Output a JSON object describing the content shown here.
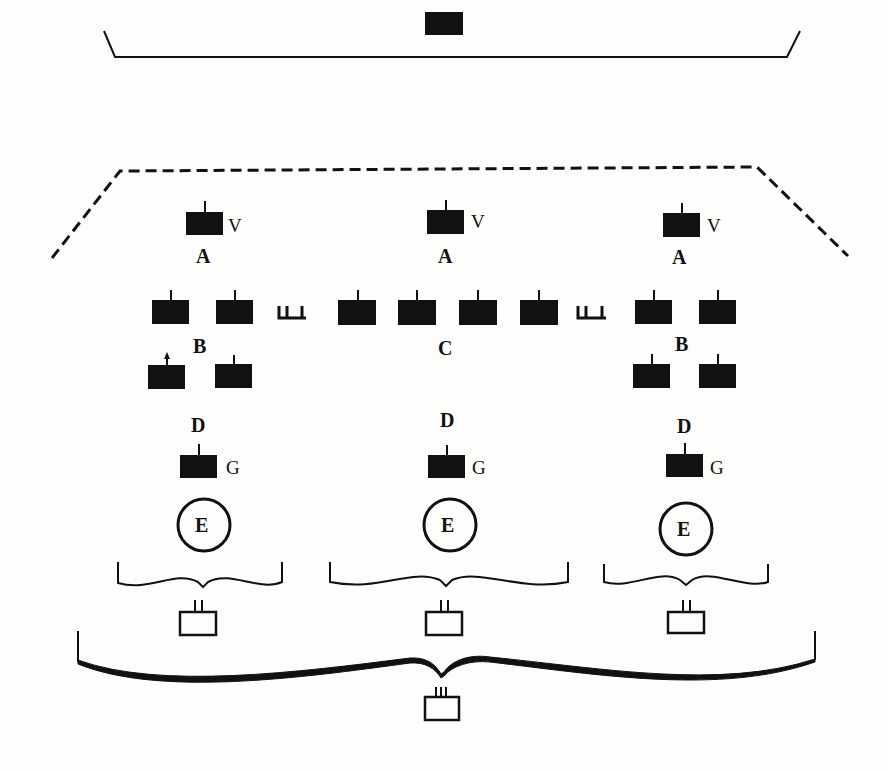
{
  "diagram": {
    "title": "",
    "top": {
      "node": "solid-unit",
      "bracket": "solid-tray-bracket"
    },
    "group_boundary": "dashed-trapezoid",
    "columns": [
      {
        "id": "left",
        "top_unit": {
          "label": "A",
          "side_label": "V"
        },
        "middle_label": "B",
        "middle_units_rows": [
          2,
          2
        ],
        "weapon_symbol_after": true,
        "lower": {
          "label": "D",
          "side_label": "G"
        },
        "circle_label": "E",
        "bracket": "brace",
        "base_box_marks": 2
      },
      {
        "id": "center",
        "top_unit": {
          "label": "A",
          "side_label": "V"
        },
        "middle_label": "C",
        "middle_units_rows": [
          4
        ],
        "weapon_symbol_after": true,
        "lower": {
          "label": "D",
          "side_label": "G"
        },
        "circle_label": "E",
        "bracket": "brace",
        "base_box_marks": 2
      },
      {
        "id": "right",
        "top_unit": {
          "label": "A",
          "side_label": "V"
        },
        "middle_label": "B",
        "middle_units_rows": [
          2,
          2
        ],
        "weapon_symbol_after": false,
        "lower": {
          "label": "D",
          "side_label": "G"
        },
        "circle_label": "E",
        "bracket": "brace",
        "base_box_marks": 2
      }
    ],
    "bottom": {
      "bracket": "large-brace",
      "base_box_marks": 3
    },
    "labels": {
      "A": "A",
      "B": "B",
      "C": "C",
      "D": "D",
      "E": "E",
      "G": "G",
      "V": "V"
    }
  }
}
